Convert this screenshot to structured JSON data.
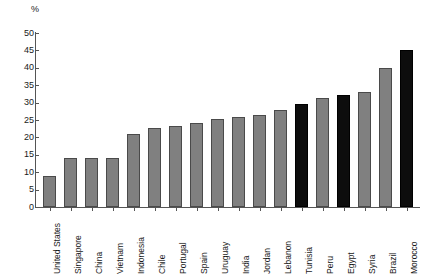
{
  "chart_data": {
    "type": "bar",
    "title": "",
    "subtitle": "",
    "xlabel": "",
    "ylabel": "%",
    "unit_label": "%",
    "ylim": [
      0,
      50
    ],
    "ytick_step": 5,
    "yticks": [
      "0",
      "5",
      "10",
      "15",
      "20",
      "25",
      "30",
      "35",
      "40",
      "45",
      "50"
    ],
    "grid": false,
    "legend": "none",
    "categories": [
      "United States",
      "Singapore",
      "China",
      "Vietnam",
      "Indonesia",
      "Chile",
      "Portugal",
      "Spain",
      "Uruguay",
      "India",
      "Jordan",
      "Lebanon",
      "Tunisia",
      "Peru",
      "Egypt",
      "Syria",
      "Brazil",
      "Morocco"
    ],
    "values": [
      9,
      14,
      14,
      14,
      21,
      22.7,
      23.2,
      24.2,
      25.2,
      26,
      26.5,
      28,
      29.7,
      31.2,
      32.2,
      33,
      40,
      45
    ],
    "bar_colors": [
      "gray",
      "gray",
      "gray",
      "gray",
      "gray",
      "gray",
      "gray",
      "gray",
      "gray",
      "gray",
      "gray",
      "gray",
      "black",
      "gray",
      "black",
      "gray",
      "gray",
      "black"
    ],
    "colors": {
      "gray": "#808080",
      "black": "#0d0d0d",
      "axis": "#555555",
      "text": "#1a1a1a",
      "background": "#ffffff"
    }
  }
}
